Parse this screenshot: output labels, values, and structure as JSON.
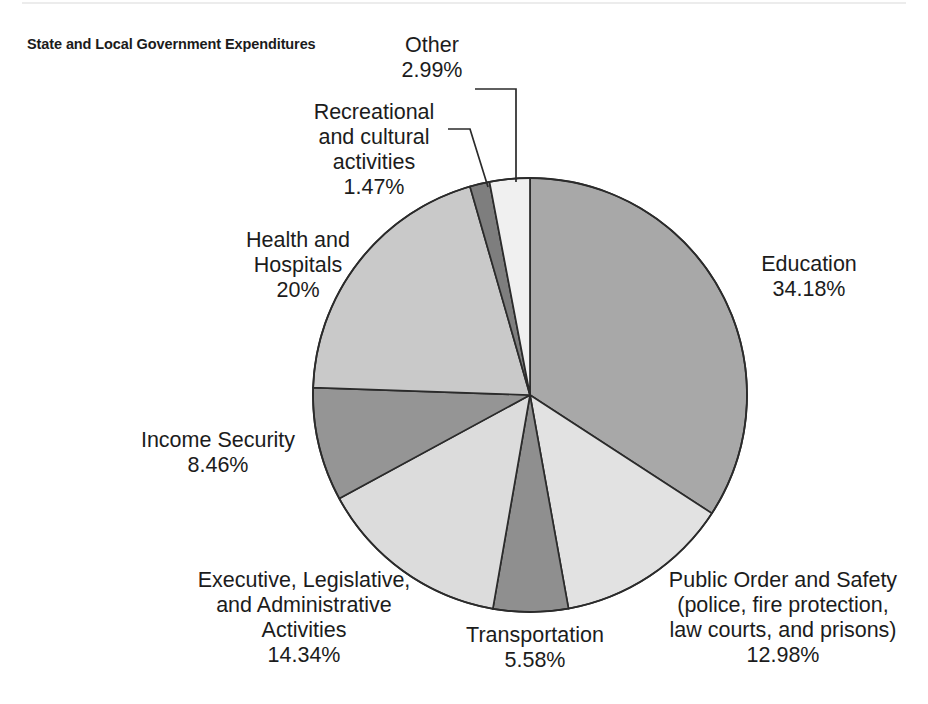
{
  "chart_title": "State and Local Government\nExpenditures",
  "chart_data": {
    "type": "pie",
    "title": "State and Local Government Expenditures",
    "units": "percent",
    "grid": false,
    "legend_position": "none",
    "label_style": "outside-with-leader-lines",
    "start_angle_deg": 0,
    "direction": "clockwise",
    "geometry": {
      "center_x": 530,
      "center_y": 395,
      "radius": 217
    },
    "categories": [
      "Education",
      "Public Order and Safety (police, fire protection, law courts, and prisons)",
      "Transportation",
      "Executive, Legislative, and Administrative Activities",
      "Income Security",
      "Health and Hospitals",
      "Recreational and cultural activities",
      "Other"
    ],
    "values": [
      34.18,
      12.98,
      5.58,
      14.34,
      8.46,
      20.0,
      1.47,
      2.99
    ],
    "total": 100.0,
    "slices": [
      {
        "label": "Education",
        "value": 34.18,
        "value_text": "34.18%",
        "color": "#a8a8a8"
      },
      {
        "label": "Public Order and Safety (police, fire protection, law courts, and prisons)",
        "value": 12.98,
        "value_text": "12.98%",
        "color": "#e2e2e2"
      },
      {
        "label": "Transportation",
        "value": 5.58,
        "value_text": "5.58%",
        "color": "#8f8f8f"
      },
      {
        "label": "Executive, Legislative, and Administrative Activities",
        "value": 14.34,
        "value_text": "14.34%",
        "color": "#dcdcdc"
      },
      {
        "label": "Income Security",
        "value": 8.46,
        "value_text": "8.46%",
        "color": "#959595"
      },
      {
        "label": "Health and Hospitals",
        "value": 20.0,
        "value_text": "20%",
        "color": "#c9c9c9"
      },
      {
        "label": "Recreational and cultural activities",
        "value": 1.47,
        "value_text": "1.47%",
        "color": "#7e7e7e"
      },
      {
        "label": "Other",
        "value": 2.99,
        "value_text": "2.99%",
        "color": "#f0f0f0"
      }
    ]
  },
  "labels": {
    "other": "Other\n2.99%",
    "recreational": "Recreational\nand cultural\nactivities\n1.47%",
    "health": "Health and\nHospitals\n20%",
    "income": "Income Security\n8.46%",
    "executive": "Executive, Legislative,\nand Administrative\nActivities\n14.34%",
    "transport": "Transportation\n5.58%",
    "public": "Public Order and Safety\n(police, fire protection,\nlaw courts, and prisons)\n12.98%",
    "education": "Education\n34.18%"
  },
  "colors": {
    "stroke": "#2b2b2b",
    "text": "#1c1c1c",
    "background": "#ffffff"
  }
}
